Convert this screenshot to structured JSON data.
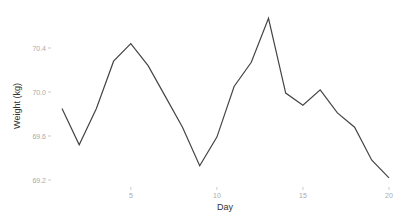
{
  "chart_data": {
    "type": "line",
    "title": "",
    "xlabel": "Day",
    "ylabel": "Weight (kg)",
    "x": [
      1,
      2,
      3,
      4,
      5,
      6,
      7,
      8,
      9,
      10,
      11,
      12,
      13,
      14,
      15,
      16,
      17,
      18,
      19,
      20
    ],
    "series": [
      {
        "name": "Weight",
        "values": [
          69.85,
          69.52,
          69.85,
          70.28,
          70.44,
          70.24,
          69.96,
          69.68,
          69.33,
          69.59,
          70.05,
          70.27,
          70.67,
          69.99,
          69.88,
          70.02,
          69.81,
          69.68,
          69.38,
          69.22
        ]
      }
    ],
    "x_ticks": [
      5,
      10,
      15,
      20
    ],
    "y_ticks": [
      69.2,
      69.6,
      70.0,
      70.4
    ],
    "x_tick_labels": [
      "5",
      "10",
      "15",
      "20"
    ],
    "y_tick_labels": [
      "69.2",
      "69.6",
      "70.0",
      "70.4"
    ],
    "xlim": [
      0.6,
      20.4
    ],
    "ylim": [
      69.18,
      70.7
    ],
    "grid": false,
    "legend": "none",
    "line_color": "#444444"
  }
}
